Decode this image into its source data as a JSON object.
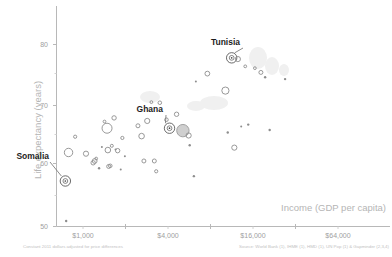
{
  "chart_data": {
    "type": "scatter",
    "title": "",
    "xlabel": "Income (GDP per capita)",
    "ylabel": "Life expectancy (years)",
    "x_scale": "log",
    "x_ticks": [
      "$1,000",
      "$4,000",
      "$16,000",
      "$64,000"
    ],
    "x_tick_values": [
      1000,
      4000,
      16000,
      64000
    ],
    "y_ticks": [
      "80",
      "70",
      "60",
      "50"
    ],
    "y_tick_values": [
      80,
      70,
      60,
      50
    ],
    "ylim": [
      50,
      85
    ],
    "xlim": [
      500,
      100000
    ],
    "grid": false,
    "legend": "none",
    "note_left": "Constant 2011 dollars adjusted for price differences",
    "note_right": "Source: World Bank (1), IHME (1), HMD (1), UN Pop (1) & Gapminder (2,3,4)",
    "annotations": [
      {
        "label": "Somalia",
        "x": 750,
        "y": 57.5
      },
      {
        "label": "Ghana",
        "x": 4100,
        "y": 66.2
      },
      {
        "label": "Tunisia",
        "x": 11300,
        "y": 77.8
      }
    ],
    "points": [
      {
        "x": 760,
        "y": 50.9,
        "size": 1.2
      },
      {
        "x": 750,
        "y": 57.5,
        "size": 3.0,
        "highlight": true,
        "name": "Somalia"
      },
      {
        "x": 790,
        "y": 62.2,
        "size": 4.2
      },
      {
        "x": 880,
        "y": 64.8,
        "size": 1.6
      },
      {
        "x": 1050,
        "y": 62.0,
        "size": 2.6
      },
      {
        "x": 1180,
        "y": 60.5,
        "size": 2.2
      },
      {
        "x": 1210,
        "y": 60.8,
        "size": 2.4
      },
      {
        "x": 1240,
        "y": 61.2,
        "size": 1.4
      },
      {
        "x": 1300,
        "y": 59.6,
        "size": 1.2
      },
      {
        "x": 1360,
        "y": 63.1,
        "size": 1.0
      },
      {
        "x": 1420,
        "y": 67.3,
        "size": 1.4
      },
      {
        "x": 1480,
        "y": 66.2,
        "size": 5.0
      },
      {
        "x": 1500,
        "y": 62.6,
        "size": 2.8
      },
      {
        "x": 1520,
        "y": 59.9,
        "size": 2.0
      },
      {
        "x": 1560,
        "y": 60.0,
        "size": 1.8
      },
      {
        "x": 1600,
        "y": 63.3,
        "size": 1.5
      },
      {
        "x": 1660,
        "y": 67.9,
        "size": 2.2
      },
      {
        "x": 1700,
        "y": 62.7,
        "size": 1.0
      },
      {
        "x": 1760,
        "y": 62.5,
        "size": 2.2
      },
      {
        "x": 1850,
        "y": 59.4,
        "size": 1.0
      },
      {
        "x": 1900,
        "y": 64.6,
        "size": 1.6
      },
      {
        "x": 1980,
        "y": 61.6,
        "size": 1.0
      },
      {
        "x": 2450,
        "y": 66.6,
        "size": 2.0
      },
      {
        "x": 2600,
        "y": 64.9,
        "size": 2.8
      },
      {
        "x": 2700,
        "y": 60.8,
        "size": 2.0
      },
      {
        "x": 2850,
        "y": 67.4,
        "size": 2.6
      },
      {
        "x": 3050,
        "y": 70.5,
        "size": 1.4
      },
      {
        "x": 3200,
        "y": 60.8,
        "size": 2.0
      },
      {
        "x": 3300,
        "y": 59.1,
        "size": 1.6
      },
      {
        "x": 3500,
        "y": 70.4,
        "size": 1.8
      },
      {
        "x": 3900,
        "y": 67.6,
        "size": 1.8
      },
      {
        "x": 4100,
        "y": 66.2,
        "size": 3.0,
        "highlight": true,
        "name": "Ghana"
      },
      {
        "x": 4600,
        "y": 68.5,
        "size": 2.2
      },
      {
        "x": 5100,
        "y": 65.8,
        "size": 6.2,
        "filled": true
      },
      {
        "x": 5600,
        "y": 65.0,
        "size": 2.6
      },
      {
        "x": 5700,
        "y": 63.4,
        "size": 1.2
      },
      {
        "x": 6100,
        "y": 58.3,
        "size": 1.2
      },
      {
        "x": 6300,
        "y": 73.9,
        "size": 1.0
      },
      {
        "x": 7600,
        "y": 75.2,
        "size": 2.4
      },
      {
        "x": 10200,
        "y": 72.4,
        "size": 3.6
      },
      {
        "x": 10600,
        "y": 65.5,
        "size": 1.2
      },
      {
        "x": 11300,
        "y": 77.8,
        "size": 3.0,
        "highlight": true,
        "name": "Tunisia"
      },
      {
        "x": 11800,
        "y": 63.0,
        "size": 2.6
      },
      {
        "x": 12500,
        "y": 77.6,
        "size": 2.6
      },
      {
        "x": 13200,
        "y": 66.5,
        "size": 1.0
      },
      {
        "x": 14100,
        "y": 76.4,
        "size": 1.4
      },
      {
        "x": 14800,
        "y": 66.8,
        "size": 1.2
      },
      {
        "x": 16500,
        "y": 76.1,
        "size": 1.4
      },
      {
        "x": 18200,
        "y": 75.4,
        "size": 2.0
      },
      {
        "x": 19500,
        "y": 74.6,
        "size": 1.2
      },
      {
        "x": 21000,
        "y": 65.9,
        "size": 1.2
      },
      {
        "x": 27000,
        "y": 74.3,
        "size": 1.2
      }
    ]
  }
}
